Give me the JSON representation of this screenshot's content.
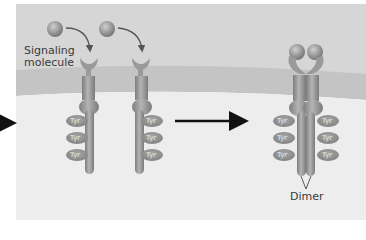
{
  "diagram": {
    "labels": {
      "signaling_molecule": [
        "Signaling",
        "molecule"
      ],
      "dimer": "Dimer"
    },
    "tyr_label": "Tyr",
    "colors": {
      "extracellular": "#d3d3d3",
      "membrane": "#c2c2c2",
      "cytoplasm": "#ededed",
      "receptor": "#9a9a9a",
      "arrow": "#111111"
    },
    "states": [
      {
        "name": "inactive-monomer-1",
        "tyr_count": 3,
        "tyr_side": "left"
      },
      {
        "name": "inactive-monomer-2",
        "tyr_count": 3,
        "tyr_side": "right"
      },
      {
        "name": "dimer",
        "tyr_count": 6,
        "tyr_side": "both"
      }
    ]
  }
}
